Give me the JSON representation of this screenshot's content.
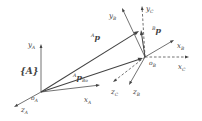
{
  "figure": {
    "name": "general-frame-transform-diagram",
    "background": "#ffffff",
    "ink": "#434343",
    "width": 202,
    "height": 121,
    "frame_label": {
      "id": "frame-A-label",
      "text": "{A}",
      "x": 20,
      "y": 74
    },
    "origins": [
      {
        "id": "origin-A",
        "main": "o",
        "sub": "A",
        "x": 31,
        "y": 100
      },
      {
        "id": "origin-B",
        "main": "o",
        "sub": "B",
        "x": 149,
        "y": 65
      }
    ],
    "axes": [
      {
        "id": "axis-y-A",
        "from": [
          41,
          92
        ],
        "to": [
          41,
          44
        ],
        "dashed": false,
        "label": {
          "sup": "",
          "main": "y",
          "sub": "A",
          "x": 28,
          "y": 47
        }
      },
      {
        "id": "axis-x-A",
        "from": [
          41,
          92
        ],
        "to": [
          100,
          85
        ],
        "dashed": false,
        "label": {
          "sup": "",
          "main": "x",
          "sub": "A",
          "x": 84,
          "y": 102
        }
      },
      {
        "id": "axis-z-A",
        "from": [
          41,
          92
        ],
        "to": [
          14,
          107
        ],
        "dashed": false,
        "label": {
          "sup": "",
          "main": "z",
          "sub": "A",
          "x": 21,
          "y": 112
        }
      },
      {
        "id": "axis-x-B",
        "from": [
          145,
          57
        ],
        "to": [
          174,
          40
        ],
        "dashed": false,
        "label": {
          "sup": "",
          "main": "x",
          "sub": "B",
          "x": 177,
          "y": 48
        }
      },
      {
        "id": "axis-y-B",
        "from": [
          145,
          57
        ],
        "to": [
          122,
          8
        ],
        "dashed": false,
        "label": {
          "sup": "",
          "main": "y",
          "sub": "B",
          "x": 109,
          "y": 18
        }
      },
      {
        "id": "axis-z-B",
        "from": [
          145,
          57
        ],
        "to": [
          129,
          85
        ],
        "dashed": false,
        "label": {
          "sup": "",
          "main": "z",
          "sub": "B",
          "x": 133,
          "y": 94
        }
      },
      {
        "id": "axis-x-C",
        "from": [
          145,
          57
        ],
        "to": [
          189,
          57
        ],
        "dashed": true,
        "label": {
          "sup": "",
          "main": "x",
          "sub": "C",
          "x": 178,
          "y": 69
        }
      },
      {
        "id": "axis-y-C",
        "from": [
          145,
          57
        ],
        "to": [
          142,
          6
        ],
        "dashed": true,
        "label": {
          "sup": "",
          "main": "y",
          "sub": "C",
          "x": 146,
          "y": 11
        }
      },
      {
        "id": "axis-z-C",
        "from": [
          145,
          57
        ],
        "to": [
          113,
          82
        ],
        "dashed": true,
        "label": {
          "sup": "",
          "main": "z",
          "sub": "C",
          "x": 111,
          "y": 94
        }
      }
    ],
    "vectors": [
      {
        "id": "vector-p-in-A",
        "from": [
          41,
          92
        ],
        "to": [
          139,
          31
        ],
        "label": {
          "sup": "A",
          "main": "p",
          "sub": "",
          "x": 91,
          "y": 40
        }
      },
      {
        "id": "vector-p-in-B",
        "from": [
          145,
          57
        ],
        "to": [
          141,
          30
        ],
        "label": {
          "sup": "B",
          "main": "p",
          "sub": "",
          "x": 152,
          "y": 33
        }
      },
      {
        "id": "vector-p-B-origin",
        "from": [
          41,
          92
        ],
        "to": [
          143,
          58
        ],
        "label": {
          "sup": "A",
          "main": "p",
          "sub": "Bo",
          "x": 73,
          "y": 80
        }
      }
    ]
  }
}
